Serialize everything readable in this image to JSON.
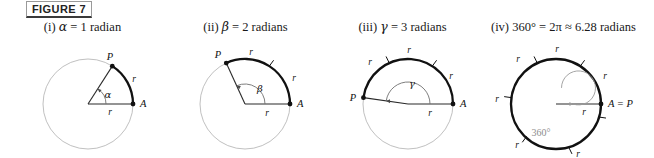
{
  "figure": {
    "label": "FIGURE 7"
  },
  "colors": {
    "arc_bold": "#111111",
    "circle_light": "#b9b9b9",
    "radius_line": "#2a2a2a",
    "angle_arc": "#6f6f6f",
    "spiral_gray": "#9a9a9a",
    "text": "#191919"
  },
  "panels": [
    {
      "id": "i",
      "numeral": "(i)",
      "symbol": "α",
      "caption_rest": " = 1 radian",
      "angle_radians": 1,
      "angle_label": "α",
      "point_start": "A",
      "point_end": "P",
      "radius_label": "r",
      "arc_labels": [
        "r"
      ],
      "arc_tick_count": 0,
      "full_circle_bold": false
    },
    {
      "id": "ii",
      "numeral": "(ii)",
      "symbol": "β",
      "caption_rest": " = 2 radians",
      "angle_radians": 2,
      "angle_label": "β",
      "point_start": "A",
      "point_end": "P",
      "radius_label": "r",
      "arc_labels": [
        "r",
        "r"
      ],
      "arc_tick_count": 1,
      "full_circle_bold": false
    },
    {
      "id": "iii",
      "numeral": "(iii)",
      "symbol": "γ",
      "caption_rest": " = 3 radians",
      "angle_radians": 3,
      "angle_label": "γ",
      "point_start": "A",
      "point_end": "P",
      "radius_label": "r",
      "arc_labels": [
        "r",
        "r",
        "r"
      ],
      "arc_tick_count": 2,
      "full_circle_bold": false
    },
    {
      "id": "iv",
      "numeral": "(iv)",
      "symbol": "360°",
      "caption_rest": " = 2π ≈ 6.28 radians",
      "angle_radians": 6.28,
      "angle_label": "360°",
      "point_start": "A = P",
      "point_end": "",
      "radius_label": "r",
      "arc_labels": [
        "r",
        "r",
        "r",
        "r",
        "r",
        "r"
      ],
      "arc_tick_count": 6,
      "full_circle_bold": true
    }
  ]
}
